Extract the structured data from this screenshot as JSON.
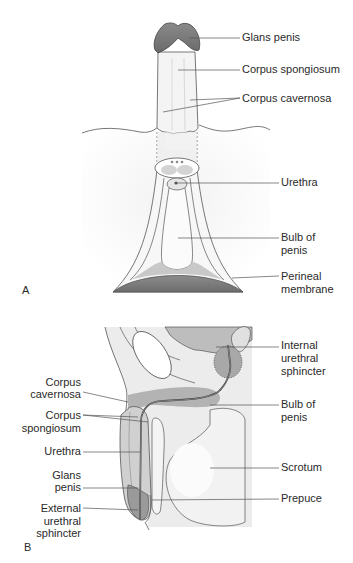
{
  "figure": {
    "panels": [
      {
        "id": "A",
        "letter": "A",
        "labels": {
          "glans_penis": "Glans penis",
          "corpus_spongiosum": "Corpus spongiosum",
          "corpus_cavernosa": "Corpus cavernosa",
          "urethra": "Urethra",
          "bulb_of_penis_1": "Bulb of",
          "bulb_of_penis_2": "penis",
          "perineal_membrane_1": "Perineal",
          "perineal_membrane_2": "membrane"
        }
      },
      {
        "id": "B",
        "letter": "B",
        "labels": {
          "corpus_cavernosa_1": "Corpus",
          "corpus_cavernosa_2": "cavernosa",
          "corpus_spongiosum_1": "Corpus",
          "corpus_spongiosum_2": "spongiosum",
          "urethra": "Urethra",
          "glans_penis_1": "Glans",
          "glans_penis_2": "penis",
          "external_urethral_sphincter_1": "External",
          "external_urethral_sphincter_2": "urethral",
          "external_urethral_sphincter_3": "sphincter",
          "internal_urethral_sphincter_1": "Internal",
          "internal_urethral_sphincter_2": "urethral",
          "internal_urethral_sphincter_3": "sphincter",
          "bulb_of_penis_1": "Bulb of",
          "bulb_of_penis_2": "penis",
          "scrotum": "Scrotum",
          "prepuce": "Prepuce"
        }
      }
    ],
    "colors": {
      "tissue_dark": "#7a7a7a",
      "tissue_mid": "#b0b0b0",
      "tissue_light": "#e6e6e6",
      "line": "#444444",
      "background": "#ffffff"
    }
  }
}
